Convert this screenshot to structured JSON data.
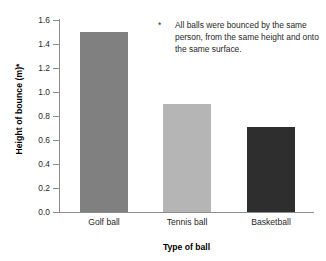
{
  "chart_data": {
    "type": "bar",
    "title": "",
    "categories": [
      "Golf ball",
      "Tennis ball",
      "Basketball"
    ],
    "values": [
      1.5,
      0.9,
      0.71
    ],
    "xlabel": "Type of ball",
    "ylabel": "Height of bounce (m)*",
    "ylim": [
      0.0,
      1.6
    ],
    "yticks": [
      "0.0",
      "0.2",
      "0.4",
      "0.6",
      "0.8",
      "1.0",
      "1.2",
      "1.4",
      "1.6"
    ],
    "ytick_values": [
      0.0,
      0.2,
      0.4,
      0.6,
      0.8,
      1.0,
      1.2,
      1.4,
      1.6
    ],
    "grid": false,
    "legend": "none",
    "bar_colors": [
      "#808080",
      "#b5b5b5",
      "#2e2e2e"
    ],
    "annotations": [
      {
        "marker": "*",
        "text": "All balls were bounced by the same person, from the same height and onto the same surface."
      }
    ]
  },
  "axes": {
    "y_title": "Height of bounce (m)*",
    "x_title": "Type of ball"
  },
  "footnote": {
    "marker": "*",
    "text": "All balls were bounced by the same person, from the same height and onto the same surface."
  },
  "colors": {
    "axis": "#8c8c8c",
    "text": "#1f1f1f",
    "background": "#ffffff"
  }
}
